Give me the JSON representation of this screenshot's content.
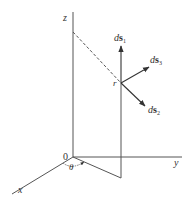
{
  "figure": {
    "colors": {
      "line": "#555555",
      "text": "#333333",
      "background": "#ffffff"
    },
    "axes": {
      "z_label": "z",
      "y_label": "y",
      "x_label": "x",
      "origin_label": "0"
    },
    "point_label": "r",
    "angle_label": "θ",
    "vectors": [
      {
        "id": "ds1",
        "prefix": "d",
        "symbol": "s",
        "subscript": "1",
        "direction": "up"
      },
      {
        "id": "ds2",
        "prefix": "d",
        "symbol": "s",
        "subscript": "2",
        "direction": "down-right"
      },
      {
        "id": "ds3",
        "prefix": "d",
        "symbol": "s",
        "subscript": "3",
        "direction": "up-right"
      }
    ]
  }
}
